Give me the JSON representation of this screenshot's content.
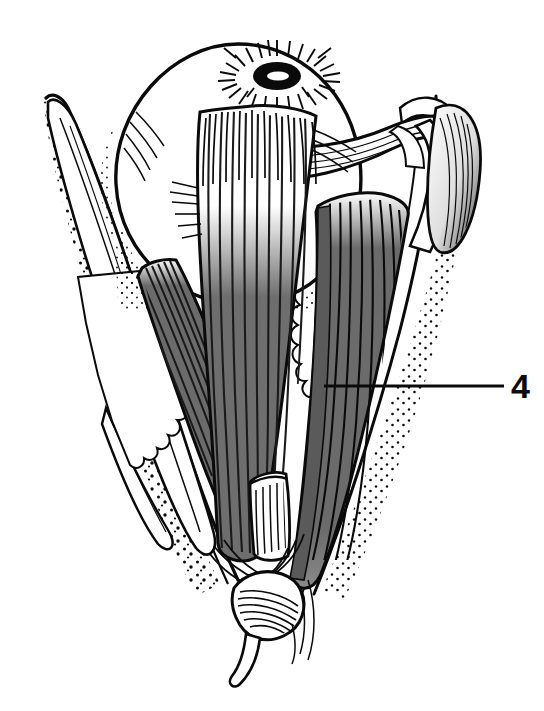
{
  "figure": {
    "kind": "anatomical-line-drawing",
    "background_color": "#ffffff",
    "ink_color": "#0a0a0a",
    "muscle_fill_color": "#6e6e6e",
    "muscle_fill_dark_color": "#5a5a5a",
    "highlight_color": "#ffffff",
    "width": 544,
    "height": 711
  },
  "annotations": {
    "labels": [
      {
        "id": "label-4",
        "text": "4",
        "x": 511,
        "y": 369,
        "leader_line": {
          "x1": 324,
          "y1": 386,
          "x2": 504,
          "y2": 386,
          "stroke_width": 3
        }
      }
    ]
  },
  "structures": {
    "globe": {
      "name": "eyeball",
      "center_x": 238,
      "center_y": 172,
      "radius_x": 122,
      "radius_y": 128
    },
    "cornea": {
      "name": "cornea-pupil",
      "center_x": 277,
      "center_y": 72,
      "radius_x": 22,
      "radius_y": 13,
      "ray_count": 30
    },
    "muscles": [
      {
        "name": "medial-rectus-left-band",
        "shade": "gray"
      },
      {
        "name": "central-rectus-muscle",
        "shade": "gray"
      },
      {
        "name": "lateral-rectus-right-band",
        "shade": "gray-white"
      },
      {
        "name": "superior-oblique-tendon",
        "shade": "white"
      },
      {
        "name": "cut-muscle-stump",
        "shade": "white"
      }
    ],
    "orbital_walls": [
      {
        "name": "medial-orbital-wall",
        "texture": "stipple"
      },
      {
        "name": "lateral-orbital-wall",
        "texture": "stipple"
      }
    ],
    "orbital_fat": {
      "name": "orbital-fat-lobules",
      "texture": "scalloped-lobules"
    },
    "apex": {
      "name": "orbital-apex-annular-tendon",
      "x": 268,
      "y": 600
    }
  }
}
